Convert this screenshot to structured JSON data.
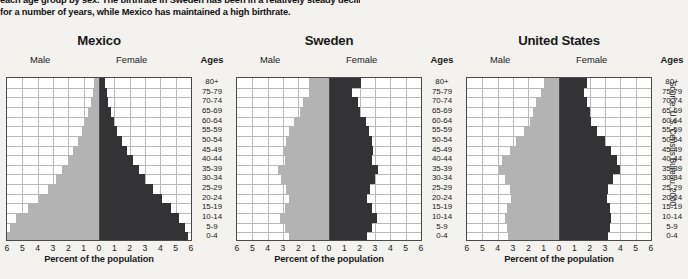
{
  "caption": {
    "line1": "each age group by sex. The birthrate in Sweden has been in a relatively steady decline",
    "line2": "for a number of years, while Mexico has maintained a high birthrate."
  },
  "source": "Source: U.S. Census Bureau, 2000",
  "labels": {
    "male": "Male",
    "female": "Female",
    "ages_header": "Ages",
    "axis_title": "Percent of the population"
  },
  "colors": {
    "male_bar": "#b3b3b3",
    "female_bar": "#333335",
    "grid": "#b9b9b9",
    "frame": "#4a4a4a",
    "background": "#f3f2ef",
    "plot_background": "#ffffff"
  },
  "age_groups": [
    "80+",
    "75-79",
    "70-74",
    "65-69",
    "60-64",
    "55-59",
    "50-54",
    "45-49",
    "40-44",
    "35-39",
    "30-34",
    "25-29",
    "20-24",
    "15-19",
    "10-14",
    "5-9",
    "0-4"
  ],
  "axis_ticks": [
    "6",
    "5",
    "4",
    "3",
    "2",
    "1",
    "0",
    "1",
    "2",
    "3",
    "4",
    "5",
    "6"
  ],
  "chart_data": [
    {
      "type": "bar",
      "title": "Mexico",
      "subtype": "population-pyramid",
      "xlabel": "Percent of the population",
      "ylabel": "Ages",
      "xlim": [
        -6,
        6
      ],
      "grid": true,
      "categories": [
        "80+",
        "75-79",
        "70-74",
        "65-69",
        "60-64",
        "55-59",
        "50-54",
        "45-49",
        "40-44",
        "35-39",
        "30-34",
        "25-29",
        "20-24",
        "15-19",
        "10-14",
        "5-9",
        "0-4"
      ],
      "series": [
        {
          "name": "Male",
          "side": "left",
          "values": [
            0.3,
            0.4,
            0.5,
            0.7,
            0.9,
            1.1,
            1.4,
            1.7,
            2.0,
            2.4,
            2.8,
            3.3,
            3.9,
            4.6,
            5.4,
            5.8,
            6.0
          ]
        },
        {
          "name": "Female",
          "side": "right",
          "values": [
            0.4,
            0.5,
            0.6,
            0.8,
            1.0,
            1.2,
            1.5,
            1.8,
            2.2,
            2.6,
            3.0,
            3.5,
            4.1,
            4.7,
            5.2,
            5.6,
            5.8
          ]
        }
      ]
    },
    {
      "type": "bar",
      "title": "Sweden",
      "subtype": "population-pyramid",
      "xlabel": "Percent of the population",
      "ylabel": "Ages",
      "xlim": [
        -6,
        6
      ],
      "grid": true,
      "categories": [
        "80+",
        "75-79",
        "70-74",
        "65-69",
        "60-64",
        "55-59",
        "50-54",
        "45-49",
        "40-44",
        "35-39",
        "30-34",
        "25-29",
        "20-24",
        "15-19",
        "10-14",
        "5-9",
        "0-4"
      ],
      "series": [
        {
          "name": "Male",
          "side": "left",
          "values": [
            1.3,
            1.3,
            1.7,
            1.9,
            2.3,
            2.6,
            2.8,
            3.0,
            2.9,
            3.3,
            3.1,
            2.8,
            2.6,
            2.9,
            3.2,
            2.9,
            2.6
          ]
        },
        {
          "name": "Female",
          "side": "right",
          "values": [
            2.1,
            1.5,
            1.9,
            2.0,
            2.4,
            2.6,
            2.8,
            2.9,
            2.8,
            3.2,
            3.0,
            2.7,
            2.5,
            2.8,
            3.1,
            2.8,
            2.5
          ]
        }
      ]
    },
    {
      "type": "bar",
      "title": "United States",
      "subtype": "population-pyramid",
      "xlabel": "Percent of the population",
      "ylabel": "Ages",
      "xlim": [
        -6,
        6
      ],
      "grid": true,
      "categories": [
        "80+",
        "75-79",
        "70-74",
        "65-69",
        "60-64",
        "55-59",
        "50-54",
        "45-49",
        "40-44",
        "35-39",
        "30-34",
        "25-29",
        "20-24",
        "15-19",
        "10-14",
        "5-9",
        "0-4"
      ],
      "series": [
        {
          "name": "Male",
          "side": "left",
          "values": [
            1.0,
            1.2,
            1.5,
            1.7,
            1.9,
            2.3,
            2.8,
            3.2,
            3.7,
            3.9,
            3.5,
            3.2,
            3.1,
            3.4,
            3.5,
            3.4,
            3.3
          ]
        },
        {
          "name": "Female",
          "side": "right",
          "values": [
            1.8,
            1.6,
            1.8,
            2.0,
            2.1,
            2.5,
            3.0,
            3.4,
            3.8,
            4.0,
            3.5,
            3.2,
            3.1,
            3.3,
            3.4,
            3.3,
            3.2
          ]
        }
      ]
    }
  ],
  "panels": [
    {
      "key": "mexico",
      "left": 6,
      "width": 197,
      "plot_left": 0,
      "plot_width": 184,
      "ages_left": 186
    },
    {
      "key": "sweden",
      "left": 236,
      "width": 197,
      "plot_left": 0,
      "plot_width": 184,
      "ages_left": 186
    },
    {
      "key": "united_states",
      "left": 466,
      "width": 197,
      "plot_left": 0,
      "plot_width": 184,
      "ages_left": 186
    }
  ]
}
